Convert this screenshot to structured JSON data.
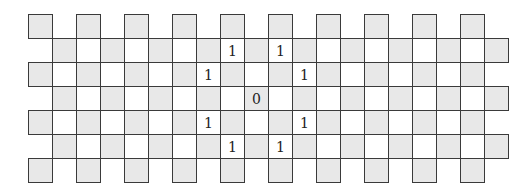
{
  "diagram": {
    "type": "grid-board",
    "origin": {
      "x": 28,
      "y": 14
    },
    "cell_size": 24,
    "colors": {
      "gray_fill": "#e8e8e8",
      "white_fill": "#ffffff",
      "line": "#3a3a3a"
    },
    "shading_rule": "gray when (row+col) even",
    "rows": [
      {
        "row": 0,
        "cols": [
          0,
          2,
          4,
          6,
          8,
          10,
          12,
          14,
          16,
          18
        ]
      },
      {
        "row": 1,
        "cols": [
          1,
          2,
          3,
          4,
          5,
          6,
          7,
          8,
          9,
          10,
          11,
          12,
          13,
          14,
          15,
          16,
          17,
          18,
          19
        ]
      },
      {
        "row": 2,
        "cols": [
          0,
          1,
          2,
          3,
          4,
          5,
          6,
          7,
          8,
          9,
          10,
          11,
          12,
          13,
          14,
          15,
          16,
          17,
          18
        ]
      },
      {
        "row": 3,
        "cols": [
          1,
          2,
          3,
          4,
          5,
          6,
          7,
          8,
          9,
          10,
          11,
          12,
          13,
          14,
          15,
          16,
          17,
          18,
          19
        ]
      },
      {
        "row": 4,
        "cols": [
          0,
          1,
          2,
          3,
          4,
          5,
          6,
          7,
          8,
          9,
          10,
          11,
          12,
          13,
          14,
          15,
          16,
          17,
          18
        ]
      },
      {
        "row": 5,
        "cols": [
          1,
          2,
          3,
          4,
          5,
          6,
          7,
          8,
          9,
          10,
          11,
          12,
          13,
          14,
          15,
          16,
          17,
          18,
          19
        ]
      },
      {
        "row": 6,
        "cols": [
          0,
          2,
          4,
          6,
          8,
          10,
          12,
          14,
          16,
          18
        ]
      }
    ],
    "labels": [
      {
        "row": 1,
        "col": 8,
        "text": "1"
      },
      {
        "row": 1,
        "col": 10,
        "text": "1"
      },
      {
        "row": 2,
        "col": 7,
        "text": "1"
      },
      {
        "row": 2,
        "col": 11,
        "text": "1"
      },
      {
        "row": 3,
        "col": 9,
        "text": "0"
      },
      {
        "row": 4,
        "col": 7,
        "text": "1"
      },
      {
        "row": 4,
        "col": 11,
        "text": "1"
      },
      {
        "row": 5,
        "col": 8,
        "text": "1"
      },
      {
        "row": 5,
        "col": 10,
        "text": "1"
      }
    ]
  }
}
